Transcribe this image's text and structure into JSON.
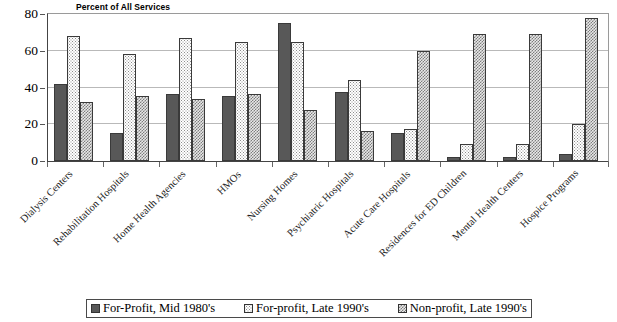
{
  "chart_data": {
    "type": "bar",
    "title": "Percent of All Services",
    "xlabel": "",
    "ylabel": "",
    "ylim": [
      0,
      80
    ],
    "yticks": [
      0,
      20,
      40,
      60,
      80
    ],
    "grid": true,
    "legend_position": "bottom",
    "categories": [
      "Dialysis Centers",
      "Rehabilitation Hospitals",
      "Home Health Agencies",
      "HMOs",
      "Nursing Homes",
      "Psychiatric Hospitals",
      "Acute Care Hospitals",
      "Residences for ED Children",
      "Mental Health Centers",
      "Hospice Programs"
    ],
    "series": [
      {
        "name": "For-Profit, Mid 1980's",
        "color": "#585858",
        "pattern": "solid",
        "values": [
          42,
          15,
          36.5,
          35.5,
          75,
          37.5,
          15,
          2,
          2,
          4
        ]
      },
      {
        "name": "For-profit, Late 1990's",
        "color": "#ffffff",
        "pattern": "dotted",
        "values": [
          68,
          58,
          67,
          64.5,
          65,
          44,
          17.5,
          9,
          9,
          20
        ]
      },
      {
        "name": "Non-profit, Late 1990's",
        "color": "#e8e8e8",
        "pattern": "checker",
        "values": [
          32,
          35.5,
          33.5,
          36.5,
          28,
          16.5,
          60,
          69,
          69,
          78
        ]
      }
    ]
  }
}
